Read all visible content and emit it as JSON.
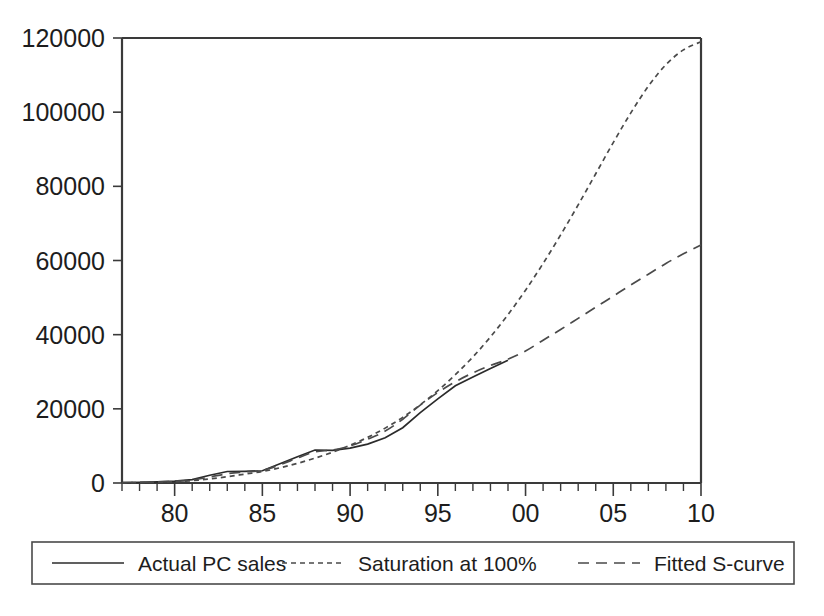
{
  "chart_data": {
    "type": "line",
    "title": "",
    "xlabel": "",
    "ylabel": "",
    "xlim": [
      77,
      110
    ],
    "ylim": [
      0,
      120000
    ],
    "grid": false,
    "legend_position": "bottom",
    "y_ticks": [
      0,
      20000,
      40000,
      60000,
      80000,
      100000,
      120000
    ],
    "y_tick_labels": [
      "0",
      "20000",
      "40000",
      "60000",
      "80000",
      "100000",
      "120000"
    ],
    "x_ticks": [
      80,
      85,
      90,
      95,
      100,
      105,
      110
    ],
    "x_tick_labels": [
      "80",
      "85",
      "90",
      "95",
      "00",
      "05",
      "10"
    ],
    "x_minor_tick_interval": 1,
    "series": [
      {
        "name": "Actual PC sales",
        "style": "solid",
        "x": [
          77,
          78,
          79,
          80,
          81,
          82,
          83,
          84,
          85,
          86,
          87,
          88,
          89,
          90,
          91,
          92,
          93,
          94,
          95,
          96,
          97,
          98,
          99
        ],
        "values": [
          100,
          180,
          300,
          520,
          900,
          2100,
          3100,
          3150,
          3300,
          5200,
          7100,
          8900,
          8800,
          9400,
          10500,
          12200,
          14900,
          19000,
          22700,
          26200,
          28600,
          30900,
          33100
        ]
      },
      {
        "name": "Saturation at 100%",
        "style": "fine-dashed",
        "x": [
          77,
          78,
          79,
          80,
          81,
          82,
          83,
          84,
          85,
          86,
          87,
          88,
          89,
          90,
          91,
          92,
          93,
          94,
          95,
          96,
          97,
          98,
          99,
          100,
          101,
          102,
          103,
          104,
          105,
          106,
          107,
          108,
          109,
          110
        ],
        "values": [
          60,
          110,
          200,
          360,
          640,
          1100,
          1700,
          2400,
          3100,
          4100,
          5300,
          6700,
          8300,
          10200,
          12300,
          14800,
          17700,
          21100,
          24900,
          29200,
          34000,
          39400,
          45400,
          52000,
          59200,
          66900,
          75000,
          83400,
          91800,
          99800,
          107000,
          112800,
          116800,
          119000
        ]
      },
      {
        "name": "Fitted S-curve",
        "style": "long-dashed",
        "x": [
          77,
          78,
          79,
          80,
          81,
          82,
          83,
          84,
          85,
          86,
          87,
          88,
          89,
          90,
          91,
          92,
          93,
          94,
          95,
          96,
          97,
          98,
          99,
          100,
          101,
          102,
          103,
          104,
          105,
          106,
          107,
          108,
          109,
          110
        ],
        "values": [
          90,
          160,
          280,
          470,
          800,
          1600,
          2500,
          3000,
          3400,
          4900,
          6700,
          8400,
          8900,
          10000,
          11800,
          14000,
          17200,
          21000,
          24400,
          27300,
          29700,
          31700,
          33400,
          35600,
          38500,
          41400,
          44400,
          47400,
          50400,
          53400,
          56300,
          59200,
          61800,
          64200
        ]
      }
    ]
  },
  "legend": {
    "items": [
      {
        "label": "Actual PC sales",
        "style": "solid"
      },
      {
        "label": "Saturation at 100%",
        "style": "fine-dashed"
      },
      {
        "label": "Fitted S-curve",
        "style": "long-dashed"
      }
    ]
  }
}
